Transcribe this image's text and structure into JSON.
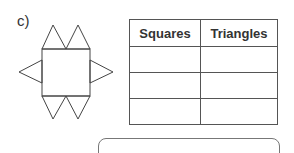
{
  "question": {
    "label": "c)"
  },
  "figure": {
    "squares": 1,
    "triangles": 6,
    "icon": "shape-net-icon"
  },
  "table": {
    "headers": [
      "Squares",
      "Triangles"
    ],
    "rows": [
      [
        "",
        ""
      ],
      [
        "",
        ""
      ],
      [
        "",
        ""
      ]
    ]
  },
  "answer_box": {
    "value": ""
  }
}
